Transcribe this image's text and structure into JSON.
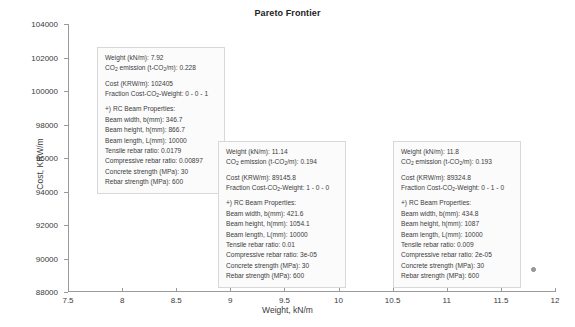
{
  "chart_data": {
    "type": "scatter",
    "title": "Pareto Frontier",
    "xlabel": "Weight, kN/m",
    "ylabel": "Cost, KRW/m",
    "xlim": [
      7.5,
      12
    ],
    "ylim": [
      88000,
      104000
    ],
    "xticks": [
      "7.5",
      "8",
      "8.5",
      "9",
      "9.5",
      "10",
      "10.5",
      "11",
      "11.5",
      "12"
    ],
    "xtick_values": [
      7.5,
      8,
      8.5,
      9,
      9.5,
      10,
      10.5,
      11,
      11.5,
      12
    ],
    "yticks": [
      "88000",
      "90000",
      "92000",
      "94000",
      "96000",
      "98000",
      "100000",
      "102000",
      "104000"
    ],
    "ytick_values": [
      88000,
      90000,
      92000,
      94000,
      96000,
      98000,
      100000,
      102000,
      104000
    ],
    "grid": false,
    "legend": "none",
    "series": [
      {
        "name": "Pareto solutions",
        "points": [
          {
            "x": 7.92,
            "y": 102405
          },
          {
            "x": 11.14,
            "y": 89145.8
          },
          {
            "x": 11.8,
            "y": 89324.8
          }
        ]
      }
    ]
  },
  "title": "Pareto Frontier",
  "axes": {
    "x_label": "Weight, kN/m",
    "y_label": "Cost, KRW/m"
  },
  "tooltips": [
    {
      "id": "tooltip-point-1",
      "weight_label": "Weight (kN/m): 7.92",
      "co2_prefix": "CO",
      "co2_sub1": "2",
      "co2_mid": " emission (t-CO",
      "co2_sub2": "2",
      "co2_suffix": "/m): 0.228",
      "cost_label": "Cost (KRW/m): 102405",
      "fraction_prefix": "Fraction Cost-CO",
      "fraction_sub": "2",
      "fraction_suffix": "-Weight: 0 - 0 - 1",
      "section_header": "+) RC Beam Properties:",
      "beam_width": "Beam width, b(mm): 346.7",
      "beam_height": "Beam height, h(mm): 866.7",
      "beam_length": "Beam length, L(mm): 10000",
      "tensile_rebar": "Tensile rebar ratio: 0.0179",
      "compressive_rebar": "Compressive rebar ratio: 0.00897",
      "concrete_strength": "Concrete strength (MPa): 30",
      "rebar_strength": "Rebar strength (MPa): 600"
    },
    {
      "id": "tooltip-point-2",
      "weight_label": "Weight (kN/m): 11.14",
      "co2_prefix": "CO",
      "co2_sub1": "2",
      "co2_mid": " emission (t-CO",
      "co2_sub2": "2",
      "co2_suffix": "/m): 0.194",
      "cost_label": "Cost (KRW/m): 89145.8",
      "fraction_prefix": "Fraction Cost-CO",
      "fraction_sub": "2",
      "fraction_suffix": "-Weight: 1 - 0 - 0",
      "section_header": "+) RC Beam Properties:",
      "beam_width": "Beam width, b(mm): 421.6",
      "beam_height": "Beam height, h(mm): 1054.1",
      "beam_length": "Beam length, L(mm): 10000",
      "tensile_rebar": "Tensile rebar ratio: 0.01",
      "compressive_rebar": "Compressive rebar ratio: 3e-05",
      "concrete_strength": "Concrete strength (MPa): 30",
      "rebar_strength": "Rebar strength (MPa): 600"
    },
    {
      "id": "tooltip-point-3",
      "weight_label": "Weight (kN/m): 11.8",
      "co2_prefix": "CO",
      "co2_sub1": "2",
      "co2_mid": " emission (t-CO",
      "co2_sub2": "2",
      "co2_suffix": "/m): 0.193",
      "cost_label": "Cost (KRW/m): 89324.8",
      "fraction_prefix": "Fraction Cost-CO",
      "fraction_sub": "2",
      "fraction_suffix": "-Weight: 0 - 1 - 0",
      "section_header": "+) RC Beam Properties:",
      "beam_width": "Beam width, b(mm): 434.8",
      "beam_height": "Beam height, h(mm): 1087",
      "beam_length": "Beam length, L(mm): 10000",
      "tensile_rebar": "Tensile rebar ratio: 0.009",
      "compressive_rebar": "Compressive rebar ratio: 2e-05",
      "concrete_strength": "Concrete strength (MPa): 30",
      "rebar_strength": "Rebar strength (MPa): 600"
    }
  ],
  "colors": {
    "marker": "#9c9c9c",
    "axis": "#9a9a9a",
    "tooltip_bg": "#fbfbfb",
    "tooltip_border": "#d8d8d8",
    "text": "#3c3c3c"
  }
}
